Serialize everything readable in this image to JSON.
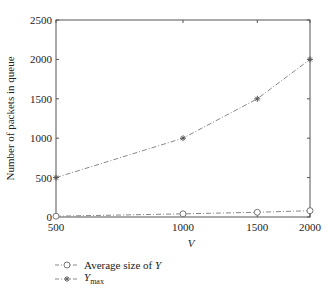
{
  "chart_data": {
    "type": "line",
    "title": "",
    "xlabel": "V",
    "ylabel": "Number of packets in queue",
    "xscale": "log",
    "xlim": [
      500,
      2000
    ],
    "ylim": [
      0,
      2500
    ],
    "xticks": [
      500,
      1000,
      1500,
      2000
    ],
    "yticks": [
      0,
      500,
      1000,
      1500,
      2000,
      2500
    ],
    "x": [
      500,
      1000,
      1500,
      2000
    ],
    "series": [
      {
        "name": "Average size of Y",
        "marker": "circle",
        "line": "dash-dot",
        "color": "#888888",
        "values": [
          10,
          40,
          60,
          80
        ]
      },
      {
        "name": "Y_max",
        "marker": "star",
        "line": "dash-dot",
        "color": "#888888",
        "values": [
          500,
          1000,
          1500,
          2000
        ]
      }
    ],
    "grid": false,
    "legend_position": "bottom-left"
  },
  "legend": {
    "avg_label": "Average size of ",
    "avg_var": "Y",
    "max_var": "Y",
    "max_sub": "max"
  }
}
